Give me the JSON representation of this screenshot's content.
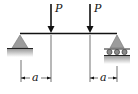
{
  "diagram": {
    "type": "simply supported beam",
    "loads": [
      {
        "label": "P",
        "x": 51
      },
      {
        "label": "P",
        "x": 90
      }
    ],
    "dimensions": [
      {
        "label": "a",
        "from": 21,
        "to": 51
      },
      {
        "label": "a",
        "from": 90,
        "to": 117
      }
    ],
    "supports": [
      {
        "type": "pin",
        "side": "left"
      },
      {
        "type": "roller",
        "side": "right"
      }
    ],
    "colors": {
      "line": "#111111",
      "support_fill": "#999999",
      "ground": "#cccccc"
    }
  }
}
